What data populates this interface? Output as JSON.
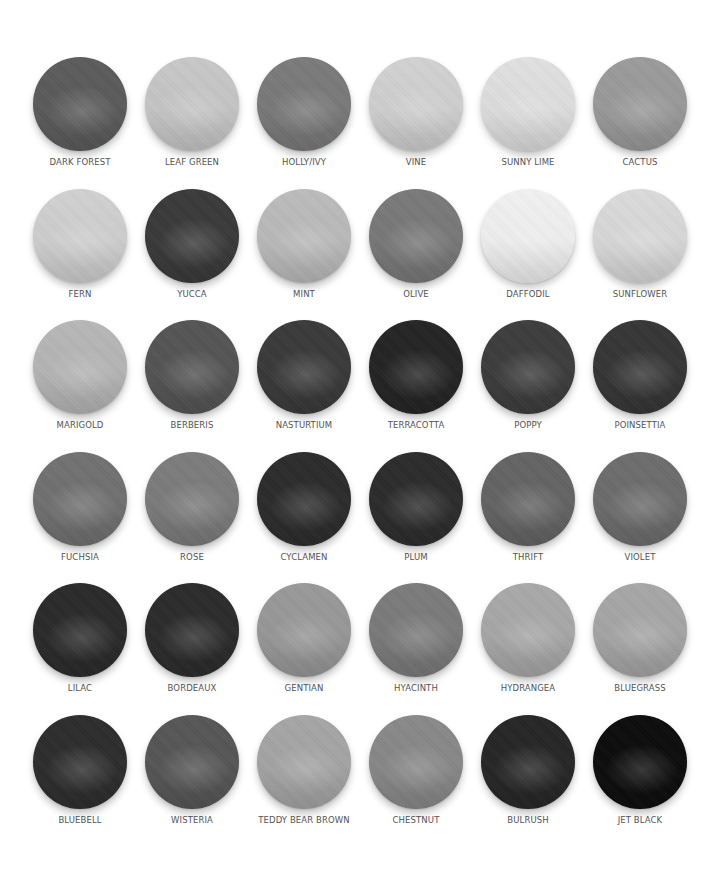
{
  "swatches": [
    {
      "name": "DARK FOREST",
      "color": "#5c5c5c"
    },
    {
      "name": "LEAF GREEN",
      "color": "#c9c9c9"
    },
    {
      "name": "HOLLY/IVY",
      "color": "#7b7b7b"
    },
    {
      "name": "VINE",
      "color": "#d3d3d3"
    },
    {
      "name": "SUNNY LIME",
      "color": "#e2e2e2"
    },
    {
      "name": "CACTUS",
      "color": "#9c9c9c"
    },
    {
      "name": "FERN",
      "color": "#d2d2d2"
    },
    {
      "name": "YUCCA",
      "color": "#3a3a3a"
    },
    {
      "name": "MINT",
      "color": "#bdbdbd"
    },
    {
      "name": "OLIVE",
      "color": "#7a7a7a"
    },
    {
      "name": "DAFFODIL",
      "color": "#f3f3f3"
    },
    {
      "name": "SUNFLOWER",
      "color": "#dcdcdc"
    },
    {
      "name": "MARIGOLD",
      "color": "#b8b8b8"
    },
    {
      "name": "BERBERIS",
      "color": "#555555"
    },
    {
      "name": "NASTURTIUM",
      "color": "#3a3a3a"
    },
    {
      "name": "TERRACOTTA",
      "color": "#242424"
    },
    {
      "name": "POPPY",
      "color": "#3d3d3d"
    },
    {
      "name": "POINSETTIA",
      "color": "#363636"
    },
    {
      "name": "FUCHSIA",
      "color": "#727272"
    },
    {
      "name": "ROSE",
      "color": "#7d7d7d"
    },
    {
      "name": "CYCLAMEN",
      "color": "#2c2c2c"
    },
    {
      "name": "PLUM",
      "color": "#2c2c2c"
    },
    {
      "name": "THRIFT",
      "color": "#656565"
    },
    {
      "name": "VIOLET",
      "color": "#6e6e6e"
    },
    {
      "name": "LILAC",
      "color": "#2a2a2a"
    },
    {
      "name": "BORDEAUX",
      "color": "#2b2b2b"
    },
    {
      "name": "GENTIAN",
      "color": "#9a9a9a"
    },
    {
      "name": "HYACINTH",
      "color": "#7c7c7c"
    },
    {
      "name": "HYDRANGEA",
      "color": "#aaaaaa"
    },
    {
      "name": "BLUEGRASS",
      "color": "#a8a8a8"
    },
    {
      "name": "BLUEBELL",
      "color": "#2d2d2d"
    },
    {
      "name": "WISTERIA",
      "color": "#575757"
    },
    {
      "name": "TEDDY BEAR BROWN",
      "color": "#a7a7a7"
    },
    {
      "name": "CHESTNUT",
      "color": "#8a8a8a"
    },
    {
      "name": "BULRUSH",
      "color": "#262626"
    },
    {
      "name": "JET BLACK",
      "color": "#0c0c0c"
    }
  ]
}
